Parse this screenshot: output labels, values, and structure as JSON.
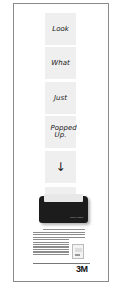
{
  "ad": {
    "notes": [
      {
        "text": "Look"
      },
      {
        "text": "What"
      },
      {
        "text": "Just"
      },
      {
        "text": "Popped Up."
      },
      {
        "text": "↓"
      },
      {
        "text": ""
      }
    ],
    "product": {
      "name": "Pop-up Post-it dispenser",
      "label": "Post-it • Notes"
    },
    "body_copy": "Now everything Post-it brand notes can ever hope to be, just pops up one at a time on your desk. Our dispenser puts the notes in front of you. Post-it Pop-up notes. Just pull one out and another pops right up, ready for your next message.",
    "brand_logo": "3M",
    "colors": {
      "frame_border": "#8a8a8a",
      "note_fill": "#efefef",
      "dispenser": "#1c1c1c",
      "logo": "#111111"
    }
  }
}
